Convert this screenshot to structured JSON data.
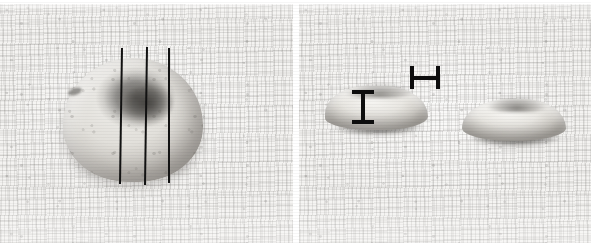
{
  "figure": {
    "modality": "grayscale photograph",
    "background_description": "woven textured cloth / paper backdrop",
    "width_px": 591,
    "height_px": 243,
    "panel_gutter_color": "#ffffff",
    "ink_color": "#0d0d0d",
    "specimen_highlight": "#f6f5f2",
    "specimen_shadow": "#46443f"
  },
  "panels": [
    {
      "id": "panel-left",
      "label": "",
      "view": "superior / en-face view of intact nodular specimen",
      "x": 0,
      "y": 0,
      "width": 294,
      "height": 243,
      "specimens": [
        {
          "name": "intact-nodule",
          "shape": "rounded dome with central depression",
          "x": 63,
          "y": 58,
          "width": 140,
          "height": 124,
          "features": [
            {
              "name": "central-umbilication",
              "x": 119,
              "y": 82,
              "width": 54,
              "height": 44
            },
            {
              "name": "peripheral-fleck",
              "x": 68,
              "y": 88,
              "width": 14,
              "height": 7
            }
          ]
        }
      ],
      "annotations": {
        "type": "section-lines",
        "count": 3,
        "description": "three ruled sectioning lines drawn across the specimen",
        "lines": [
          {
            "name": "section-line-1",
            "top_x": 121,
            "bottom_x": 119,
            "top_y": 48,
            "bottom_y": 184,
            "thickness": 2
          },
          {
            "name": "section-line-2",
            "top_x": 146,
            "bottom_x": 144,
            "top_y": 47,
            "bottom_y": 185,
            "thickness": 2
          },
          {
            "name": "section-line-3",
            "top_x": 168,
            "bottom_x": 168,
            "top_y": 48,
            "bottom_y": 183,
            "thickness": 2
          }
        ]
      }
    },
    {
      "id": "panel-right",
      "label": "",
      "view": "cut surface / profile view of bisected specimen halves",
      "x": 299,
      "y": 0,
      "width": 292,
      "height": 243,
      "specimens": [
        {
          "name": "cut-half-left",
          "shape": "shallow elongated dome, cut face upward",
          "x": 325,
          "y": 86,
          "width": 103,
          "height": 44
        },
        {
          "name": "cut-half-right",
          "shape": "shallow elongated dome, cut face upward",
          "x": 462,
          "y": 99,
          "width": 104,
          "height": 42
        }
      ],
      "annotations": {
        "type": "scale-bars",
        "count": 2,
        "bars": [
          {
            "name": "scalebar-vertical",
            "orientation": "vertical",
            "meaning": "lesion thickness / depth marker",
            "glyph": "I",
            "x": 352,
            "y": 90,
            "width": 22,
            "height": 34,
            "caption": ""
          },
          {
            "name": "scalebar-horizontal",
            "orientation": "horizontal",
            "meaning": "lesion width marker",
            "glyph": "H",
            "x": 410,
            "y": 66,
            "width": 30,
            "height": 23,
            "caption": ""
          }
        ]
      }
    }
  ]
}
